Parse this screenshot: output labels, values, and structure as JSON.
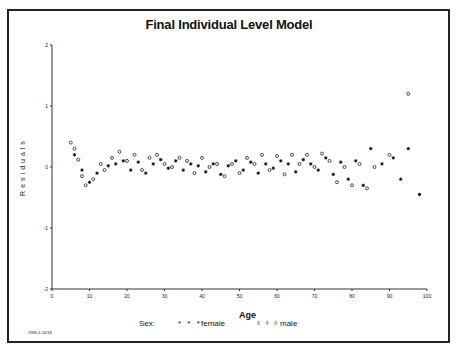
{
  "chart_data": {
    "type": "scatter",
    "title": "Final Individual Level Model",
    "xlabel": "Age",
    "ylabel": "Residuals",
    "xlim": [
      0,
      100
    ],
    "ylim": [
      -2,
      2
    ],
    "xticks": [
      "0",
      "10",
      "20",
      "30",
      "40",
      "50",
      "60",
      "70",
      "80",
      "90",
      "100"
    ],
    "yticks": [
      "2",
      "1",
      "0",
      "-1",
      "-2"
    ],
    "grid": false,
    "legend": {
      "title": "Sex:",
      "position": "bottom",
      "entries": [
        {
          "label": "female",
          "symbol": "* * *",
          "marker": "star"
        },
        {
          "label": "male",
          "symbol": "◊ ◊ ◊",
          "marker": "diamond"
        }
      ]
    },
    "series": [
      {
        "name": "female",
        "marker": "star",
        "points": [
          [
            6,
            0.2
          ],
          [
            8,
            -0.05
          ],
          [
            10,
            -0.25
          ],
          [
            12,
            -0.1
          ],
          [
            15,
            0.02
          ],
          [
            17,
            0.05
          ],
          [
            19,
            0.1
          ],
          [
            21,
            -0.05
          ],
          [
            23,
            0.08
          ],
          [
            25,
            -0.1
          ],
          [
            27,
            0.05
          ],
          [
            29,
            0.12
          ],
          [
            31,
            -0.02
          ],
          [
            33,
            0.1
          ],
          [
            35,
            -0.05
          ],
          [
            37,
            0.05
          ],
          [
            39,
            0.02
          ],
          [
            41,
            -0.08
          ],
          [
            43,
            0.05
          ],
          [
            45,
            -0.12
          ],
          [
            47,
            0.02
          ],
          [
            49,
            0.1
          ],
          [
            51,
            -0.05
          ],
          [
            53,
            0.08
          ],
          [
            55,
            -0.1
          ],
          [
            57,
            0.05
          ],
          [
            59,
            -0.02
          ],
          [
            61,
            0.1
          ],
          [
            63,
            0.05
          ],
          [
            65,
            -0.08
          ],
          [
            67,
            0.12
          ],
          [
            69,
            0.05
          ],
          [
            71,
            -0.05
          ],
          [
            73,
            0.15
          ],
          [
            75,
            -0.12
          ],
          [
            77,
            0.08
          ],
          [
            79,
            -0.2
          ],
          [
            81,
            0.1
          ],
          [
            83,
            -0.3
          ],
          [
            85,
            0.3
          ],
          [
            88,
            0.05
          ],
          [
            91,
            0.15
          ],
          [
            93,
            -0.2
          ],
          [
            95,
            0.3
          ],
          [
            98,
            -0.45
          ]
        ]
      },
      {
        "name": "male",
        "marker": "diamond",
        "points": [
          [
            5,
            0.4
          ],
          [
            6,
            0.3
          ],
          [
            7,
            0.12
          ],
          [
            8,
            -0.15
          ],
          [
            9,
            -0.3
          ],
          [
            11,
            -0.2
          ],
          [
            13,
            0.05
          ],
          [
            14,
            -0.05
          ],
          [
            16,
            0.15
          ],
          [
            18,
            0.25
          ],
          [
            20,
            0.1
          ],
          [
            22,
            0.2
          ],
          [
            24,
            -0.05
          ],
          [
            26,
            0.15
          ],
          [
            28,
            0.2
          ],
          [
            30,
            0.05
          ],
          [
            32,
            0.0
          ],
          [
            34,
            0.15
          ],
          [
            36,
            0.1
          ],
          [
            38,
            -0.1
          ],
          [
            40,
            0.15
          ],
          [
            42,
            0.0
          ],
          [
            44,
            0.05
          ],
          [
            46,
            -0.15
          ],
          [
            48,
            0.05
          ],
          [
            50,
            -0.1
          ],
          [
            52,
            0.15
          ],
          [
            54,
            0.05
          ],
          [
            56,
            0.2
          ],
          [
            58,
            -0.05
          ],
          [
            60,
            0.18
          ],
          [
            62,
            -0.12
          ],
          [
            64,
            0.2
          ],
          [
            66,
            0.05
          ],
          [
            68,
            0.2
          ],
          [
            70,
            0.0
          ],
          [
            72,
            0.22
          ],
          [
            74,
            0.1
          ],
          [
            76,
            -0.25
          ],
          [
            78,
            0.0
          ],
          [
            80,
            -0.3
          ],
          [
            82,
            0.05
          ],
          [
            84,
            -0.35
          ],
          [
            86,
            0.0
          ],
          [
            90,
            0.2
          ],
          [
            95,
            1.2
          ]
        ]
      }
    ]
  },
  "footer": {
    "code": "1986-4-16/18"
  }
}
